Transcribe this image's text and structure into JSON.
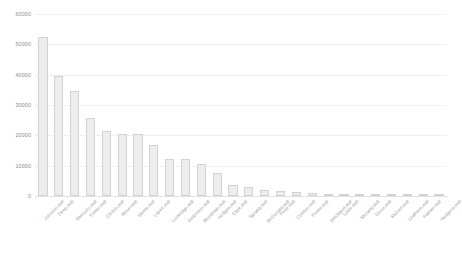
{
  "chart_data": {
    "type": "bar",
    "title": "",
    "xlabel": "",
    "ylabel": "",
    "ylim": [
      0,
      60000
    ],
    "yticks": [
      60000,
      50000,
      40000,
      30000,
      20000,
      10000,
      0
    ],
    "ytick_labels": [
      "60000",
      "50000",
      "40000",
      "30000",
      "20000",
      "10000",
      "0"
    ],
    "grid": true,
    "legend": null,
    "categories": [
      "Johnson.mdl",
      "Deep.mdl",
      "Mercurio.mdl",
      "Foster.mdl",
      "Clinton.mdl",
      "Winer.mdl",
      "Steele.mdl",
      "Lopez.mdl",
      "Lockridge.mdl",
      "Dickinson.mdl",
      "Woodman.mdl",
      "Hodges.mdl",
      "Clark.mdl",
      "Tanaka.mdl",
      "McDonald.mdl",
      "Price.mdl",
      "Colston.mdl",
      "Flores.mdl",
      "Strickland.mdl",
      "Lokie.mdl",
      "Mccarty.mdl",
      "Dixon.mdl",
      "Mulvell.mdl",
      "Leathers.mdl",
      "Palmer.mdl",
      "Hudgens.mdl"
    ],
    "values": [
      52500,
      39500,
      34500,
      25800,
      21500,
      20500,
      20400,
      16800,
      12300,
      12200,
      10700,
      7600,
      3600,
      2900,
      2000,
      1500,
      1200,
      900,
      800,
      700,
      600,
      550,
      500,
      450,
      400,
      350
    ],
    "bar_fill": "#ededed",
    "bar_border": "#d2d2d2",
    "gridline_color": "#f0f0f0",
    "tick_text_color": "#8d8d8d",
    "label_text_color": "#9a9a9a"
  }
}
